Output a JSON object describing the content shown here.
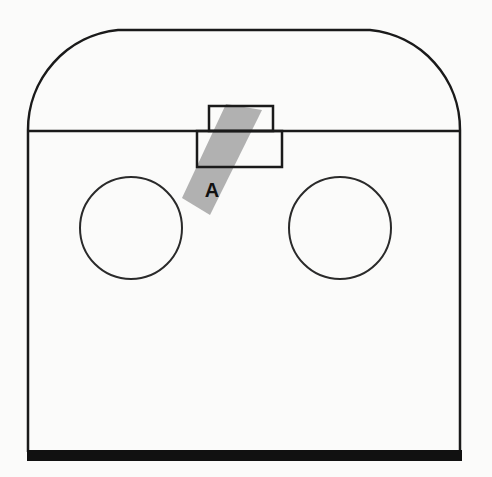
{
  "diagram": {
    "label_a": "A",
    "colors": {
      "stroke": "#1a1a1a",
      "shade": "#a9a9a9",
      "background": "#fbfbfa"
    }
  }
}
